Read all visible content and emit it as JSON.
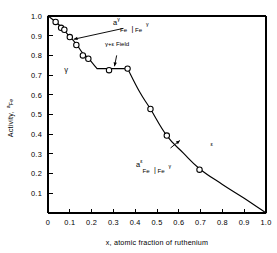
{
  "chart_data": {
    "type": "line",
    "title": "",
    "xlabel": "x, atomic fraction of ruthenium",
    "ylabel": "Activity, a_Fe",
    "ylabel_main": "Activity,",
    "ylabel_sym": "a",
    "ylabel_sub": "Fe",
    "xlim": [
      0,
      1.0
    ],
    "ylim": [
      0,
      1.0
    ],
    "grid": false,
    "legend": "none",
    "xticks": [
      "0",
      "0.1",
      "0.2",
      "0.3",
      "0.4",
      "0.5",
      "0.6",
      "0.7",
      "0.8",
      "0.9",
      "1.0"
    ],
    "xtick_values": [
      0,
      0.1,
      0.2,
      0.3,
      0.4,
      0.5,
      0.6,
      0.7,
      0.8,
      0.9,
      1.0
    ],
    "yticks": [
      "0.1",
      "0.2",
      "0.3",
      "0.4",
      "0.5",
      "0.6",
      "0.7",
      "0.8",
      "0.9",
      "1.0"
    ],
    "ytick_values": [
      0.1,
      0.2,
      0.3,
      0.4,
      0.5,
      0.6,
      0.7,
      0.8,
      0.9,
      1.0
    ],
    "series": [
      {
        "name": "Iron activity in Fe-Ru alloys",
        "marker": "open-circle",
        "x": [
          0.0,
          0.035,
          0.06,
          0.075,
          0.1,
          0.13,
          0.16,
          0.185,
          0.28,
          0.365,
          0.47,
          0.545,
          0.695,
          1.0
        ],
        "values": [
          1.0,
          0.97,
          0.94,
          0.93,
          0.893,
          0.853,
          0.8,
          0.783,
          0.725,
          0.733,
          0.528,
          0.393,
          0.22,
          0.0
        ]
      }
    ],
    "curve_path": [
      {
        "x": 0.0,
        "y": 1.0
      },
      {
        "x": 0.035,
        "y": 0.97
      },
      {
        "x": 0.06,
        "y": 0.945
      },
      {
        "x": 0.1,
        "y": 0.895
      },
      {
        "x": 0.13,
        "y": 0.857
      },
      {
        "x": 0.16,
        "y": 0.81
      },
      {
        "x": 0.185,
        "y": 0.785
      },
      {
        "x": 0.225,
        "y": 0.733
      },
      {
        "x": 0.28,
        "y": 0.733
      },
      {
        "x": 0.365,
        "y": 0.733
      },
      {
        "x": 0.42,
        "y": 0.615
      },
      {
        "x": 0.47,
        "y": 0.528
      },
      {
        "x": 0.545,
        "y": 0.393
      },
      {
        "x": 0.62,
        "y": 0.305
      },
      {
        "x": 0.695,
        "y": 0.225
      },
      {
        "x": 0.8,
        "y": 0.145
      },
      {
        "x": 0.9,
        "y": 0.075
      },
      {
        "x": 1.0,
        "y": 0.0
      }
    ],
    "annotations": [
      {
        "id": "gamma-gamma-activity",
        "parts": {
          "a": "a",
          "sup1": "γ",
          "sub1": "Fe",
          "bar": "|",
          "sub2": "Fe",
          "sup2": "γ"
        },
        "text": "aγFe | Feγ",
        "leader_from": {
          "x": 0.345,
          "y": 0.937
        },
        "leader_to": {
          "x": 0.118,
          "y": 0.882
        }
      },
      {
        "id": "gamma-plus-epsilon-field",
        "text": "γ+ε Field",
        "leader_from": {
          "x": 0.315,
          "y": 0.8
        },
        "leader_to": {
          "x": 0.305,
          "y": 0.745
        }
      },
      {
        "id": "epsilon-gamma-activity",
        "parts": {
          "a": "a",
          "sup1": "ε",
          "sub1": "Fe",
          "bar": "|",
          "sub2": "Fe",
          "sup2": "γ"
        },
        "text": "aεFe | Feγ",
        "leader_from": {
          "x": 0.562,
          "y": 0.33
        },
        "leader_to": {
          "x": 0.605,
          "y": 0.368
        }
      },
      {
        "id": "phase-label-gamma",
        "text": "γ",
        "x": 0.075,
        "y": 0.718
      },
      {
        "id": "phase-label-epsilon",
        "text": "ε",
        "x": 0.745,
        "y": 0.338
      }
    ]
  }
}
